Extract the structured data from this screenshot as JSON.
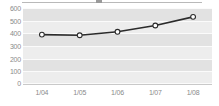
{
  "chart_data": {
    "type": "line",
    "title": "",
    "xlabel": "",
    "ylabel": "",
    "categories": [
      "1/04",
      "1/05",
      "1/06",
      "1/07",
      "1/08"
    ],
    "values": [
      390,
      385,
      412,
      462,
      530
    ],
    "series": [
      {
        "name": "series-1",
        "values": [
          390,
          385,
          412,
          462,
          530
        ]
      }
    ],
    "ylim": [
      0,
      600
    ],
    "ytick_step": 100,
    "ytick_labels": [
      "600",
      "500",
      "400",
      "300",
      "200",
      "100",
      "0"
    ],
    "ytick_values": [
      600,
      500,
      400,
      300,
      200,
      100,
      0
    ],
    "grid": true,
    "legend": "none",
    "marker": "open-circle",
    "colors": {
      "line": "#2b2b2b",
      "marker_fill": "#ffffff",
      "marker_stroke": "#2b2b2b",
      "plot_background": "#ededed",
      "band": "#e2e2e2",
      "gridline": "#fbfbfb",
      "tick_text": "#8a8a8a"
    }
  }
}
